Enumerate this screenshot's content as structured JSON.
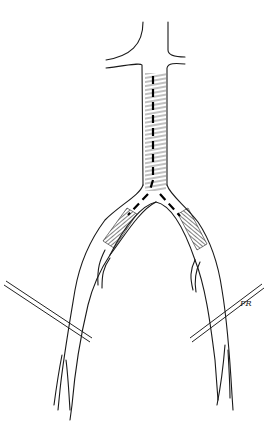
{
  "figure": {
    "type": "medical-illustration",
    "signature": "FR",
    "colors": {
      "background": "#ffffff",
      "line": "#1a1a1a"
    },
    "elements": {
      "aorta": "abdominal-aorta",
      "renal_branches": [
        "left-renal-artery",
        "right-renal-artery"
      ],
      "hatched_regions": [
        "aorta-hatched",
        "left-iliac-hatched",
        "right-iliac-hatched"
      ],
      "clamps": [
        "left-clamp",
        "right-clamp"
      ],
      "branches": [
        "left-internal-iliac",
        "right-internal-iliac"
      ]
    }
  }
}
